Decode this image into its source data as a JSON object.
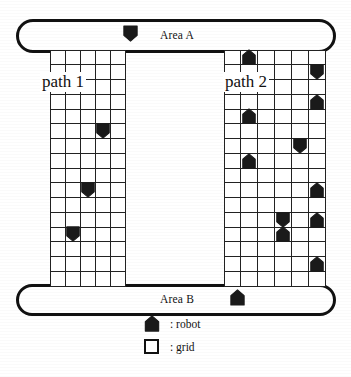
{
  "figure": {
    "areas": [
      {
        "id": "area-a",
        "label": "Area A"
      },
      {
        "id": "area-b",
        "label": "Area B"
      }
    ],
    "paths": [
      {
        "id": "path1",
        "label": "path 1",
        "columns": 5,
        "rows": 16
      },
      {
        "id": "path2",
        "label": "path 2",
        "columns": 6,
        "rows": 16
      }
    ],
    "legend": {
      "items": [
        {
          "icon": "robot-icon",
          "label": ": robot"
        },
        {
          "icon": "grid-icon",
          "label": ": grid"
        }
      ]
    },
    "area_robots": [
      {
        "area": "Area A",
        "orientation": "down",
        "x": 122,
        "y": 24
      },
      {
        "area": "Area B",
        "orientation": "up",
        "x": 229,
        "y": 288
      }
    ],
    "path1_robots": [
      {
        "col": 4,
        "row": 6,
        "orientation": "down"
      },
      {
        "col": 3,
        "row": 10,
        "orientation": "down"
      },
      {
        "col": 2,
        "row": 13,
        "orientation": "down"
      }
    ],
    "path2_robots": [
      {
        "col": 2,
        "row": 1,
        "orientation": "up"
      },
      {
        "col": 6,
        "row": 2,
        "orientation": "down"
      },
      {
        "col": 6,
        "row": 4,
        "orientation": "up"
      },
      {
        "col": 2,
        "row": 5,
        "orientation": "up"
      },
      {
        "col": 5,
        "row": 7,
        "orientation": "down"
      },
      {
        "col": 2,
        "row": 8,
        "orientation": "up"
      },
      {
        "col": 6,
        "row": 10,
        "orientation": "up"
      },
      {
        "col": 4,
        "row": 12,
        "orientation": "down"
      },
      {
        "col": 6,
        "row": 12,
        "orientation": "up"
      },
      {
        "col": 4,
        "row": 13,
        "orientation": "up"
      },
      {
        "col": 6,
        "row": 15,
        "orientation": "up"
      }
    ],
    "colors": {
      "ink": "#111111",
      "paper": "#ffffff",
      "robot_fill": "#1a1a1a"
    }
  }
}
